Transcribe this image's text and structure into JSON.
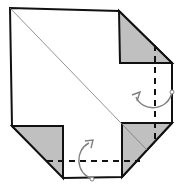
{
  "diagram": {
    "type": "origami-fold-step",
    "colors": {
      "paper": "#ffffff",
      "flap": "#c0c0c0",
      "edge": "#111111",
      "crease": "#777777",
      "arrow": "#808080"
    },
    "outline": "10,8 119,11 172,63 172,123 122,177 64,178 12,126",
    "flaps": [
      {
        "name": "top-right-flap",
        "points": "119,11 172,63 120,63"
      },
      {
        "name": "bottom-right-flap",
        "points": "122,123 172,123 122,177"
      },
      {
        "name": "bottom-left-flap",
        "points": "12,126 63,126 63,178"
      }
    ],
    "diagonal_crease": {
      "x1": 10,
      "y1": 8,
      "x2": 147,
      "y2": 150
    },
    "fold_lines": [
      {
        "name": "vertical-valley-fold",
        "x1": 155,
        "y1": 45,
        "x2": 155,
        "y2": 140
      },
      {
        "name": "horizontal-valley-fold",
        "x1": 47,
        "y1": 161,
        "x2": 140,
        "y2": 161
      }
    ],
    "arrows": [
      {
        "name": "right-fold-arrow",
        "path": "M172,92 C168,112 142,112 136,97",
        "head": "132,95 140,92 137,101",
        "pivot": {
          "cx": 172,
          "cy": 92
        }
      },
      {
        "name": "bottom-fold-arrow",
        "path": "M92,179 C75,172 75,150 89,143",
        "head": "85,141 93,140 91,148",
        "pivot": {
          "cx": 92,
          "cy": 179
        }
      }
    ]
  }
}
